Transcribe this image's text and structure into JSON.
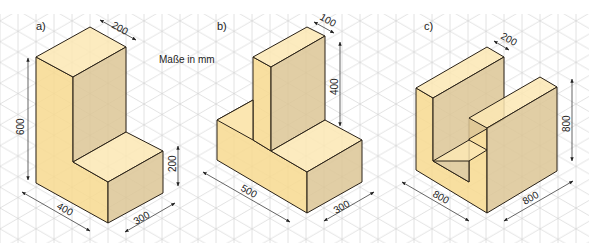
{
  "figure": {
    "units_note": "Maße in mm",
    "colors": {
      "grid": "#c9c9c9",
      "face_left": "#f7d98f",
      "face_top": "#fbe7b4",
      "face_right": "#dcc595",
      "edge": "#2a2218",
      "dim": "#222222"
    },
    "parts": [
      {
        "label": "a)",
        "dimensions": [
          "200",
          "600",
          "200",
          "400",
          "300"
        ]
      },
      {
        "label": "b)",
        "dimensions": [
          "100",
          "400",
          "500",
          "300"
        ]
      },
      {
        "label": "c)",
        "dimensions": [
          "200",
          "800",
          "800",
          "800"
        ]
      }
    ]
  }
}
